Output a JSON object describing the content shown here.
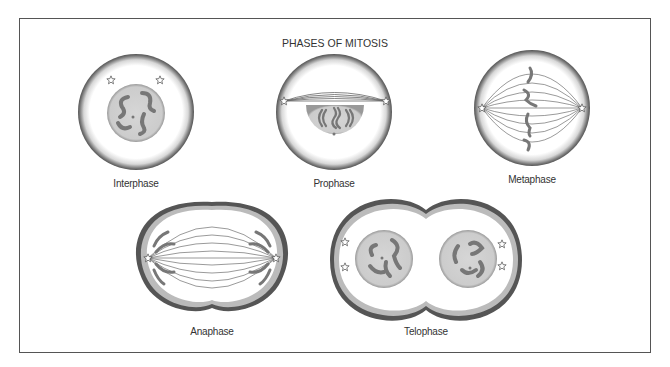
{
  "title": "PHASES OF MITOSIS",
  "phases": [
    {
      "label": "Interphase"
    },
    {
      "label": "Prophase"
    },
    {
      "label": "Metaphase"
    },
    {
      "label": "Anaphase"
    },
    {
      "label": "Telophase"
    }
  ],
  "colors": {
    "border": "#555555",
    "membrane": "#6a6a6a",
    "nucleus": "#cfcfcf",
    "chromosome": "#777777",
    "spindle": "#666666"
  }
}
